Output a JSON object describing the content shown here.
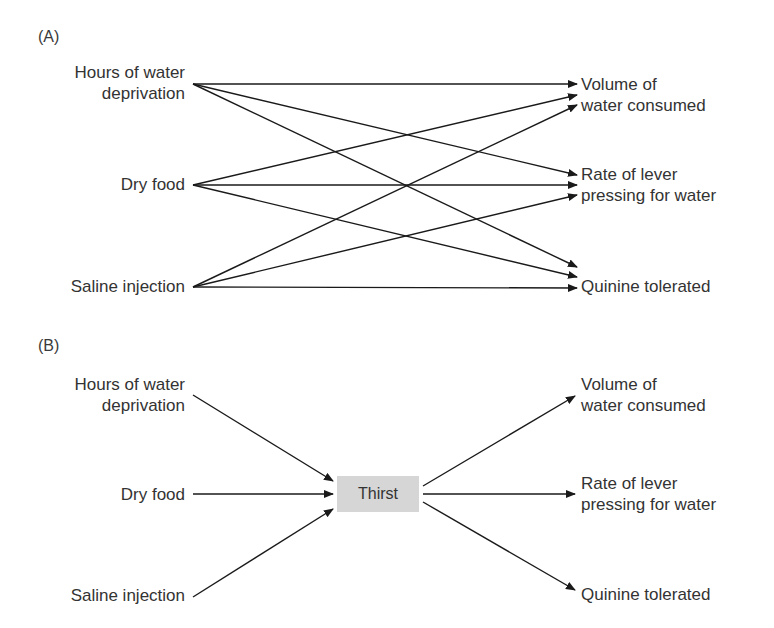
{
  "panel_a": {
    "label": "(A)",
    "inputs": [
      {
        "line1": "Hours of water",
        "line2": "deprivation"
      },
      {
        "line1": "Dry food",
        "line2": ""
      },
      {
        "line1": "Saline injection",
        "line2": ""
      }
    ],
    "outputs": [
      {
        "line1": "Volume of",
        "line2": "water consumed"
      },
      {
        "line1": "Rate of lever",
        "line2": "pressing for water"
      },
      {
        "line1": "Quinine tolerated",
        "line2": ""
      }
    ],
    "edges": [
      {
        "from": "Hours of water deprivation",
        "to": "Volume of water consumed"
      },
      {
        "from": "Hours of water deprivation",
        "to": "Rate of lever pressing for water"
      },
      {
        "from": "Hours of water deprivation",
        "to": "Quinine tolerated"
      },
      {
        "from": "Dry food",
        "to": "Volume of water consumed"
      },
      {
        "from": "Dry food",
        "to": "Rate of lever pressing for water"
      },
      {
        "from": "Dry food",
        "to": "Quinine tolerated"
      },
      {
        "from": "Saline injection",
        "to": "Volume of water consumed"
      },
      {
        "from": "Saline injection",
        "to": "Rate of lever pressing for water"
      },
      {
        "from": "Saline injection",
        "to": "Quinine tolerated"
      }
    ]
  },
  "panel_b": {
    "label": "(B)",
    "inputs": [
      {
        "line1": "Hours of water",
        "line2": "deprivation"
      },
      {
        "line1": "Dry food",
        "line2": ""
      },
      {
        "line1": "Saline injection",
        "line2": ""
      }
    ],
    "intervening_variable": {
      "label": "Thirst",
      "fill_color": "#d6d6d6"
    },
    "outputs": [
      {
        "line1": "Volume of",
        "line2": "water consumed"
      },
      {
        "line1": "Rate of lever",
        "line2": "pressing for water"
      },
      {
        "line1": "Quinine tolerated",
        "line2": ""
      }
    ],
    "edges": [
      {
        "from": "Hours of water deprivation",
        "to": "Thirst"
      },
      {
        "from": "Dry food",
        "to": "Thirst"
      },
      {
        "from": "Saline injection",
        "to": "Thirst"
      },
      {
        "from": "Thirst",
        "to": "Volume of water consumed"
      },
      {
        "from": "Thirst",
        "to": "Rate of lever pressing for water"
      },
      {
        "from": "Thirst",
        "to": "Quinine tolerated"
      }
    ]
  },
  "colors": {
    "text": "#333333",
    "arrow": "#1a1a1a",
    "background": "#ffffff"
  }
}
